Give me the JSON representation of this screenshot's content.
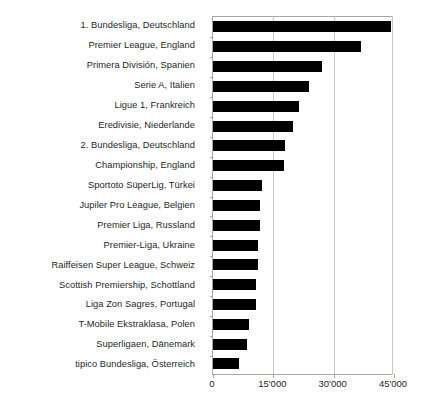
{
  "chart_data": {
    "type": "bar",
    "orientation": "horizontal",
    "title": "",
    "subtitle": "",
    "xlabel": "",
    "ylabel": "",
    "xlim": [
      0,
      45000
    ],
    "grid": true,
    "legend": null,
    "xticks": [
      0,
      15000,
      30000,
      45000
    ],
    "xticklabels": [
      "0",
      "15'000",
      "30'000",
      "45'000"
    ],
    "bar_color": "#000000",
    "categories": [
      "1. Bundesliga, Deutschland",
      "Premier League, England",
      "Primera División, Spanien",
      "Serie A, Italien",
      "Ligue 1, Frankreich",
      "Eredivisie, Niederlande",
      "2. Bundesliga, Deutschland",
      "Championship, England",
      "Sportoto SüperLig, Türkei",
      "Jupiler Pro League, Belgien",
      "Premier Liga, Russland",
      "Premier-Liga, Ukraine",
      "Raiffeisen Super League, Schweiz",
      "Scottish Premiership, Schottland",
      "Liga Zon Sagres, Portugal",
      "T-Mobile Ekstraklasa, Polen",
      "Superligaen, Dänemark",
      "tipico Bundesliga, Österreich"
    ],
    "values": [
      44200,
      36800,
      27100,
      23800,
      21300,
      19900,
      17900,
      17600,
      12200,
      11800,
      11700,
      11100,
      11200,
      10700,
      10700,
      8900,
      8400,
      6500
    ]
  }
}
